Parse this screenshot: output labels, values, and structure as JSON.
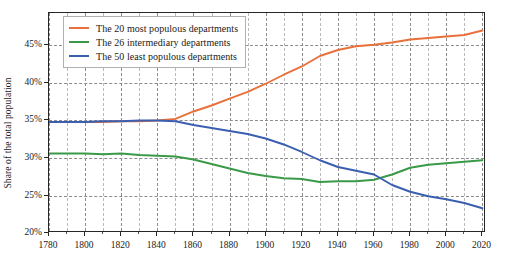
{
  "chart_data": {
    "type": "line",
    "title": "",
    "xlabel": "",
    "ylabel": "Share of the total population",
    "xlim": [
      1780,
      2022
    ],
    "ylim": [
      20,
      49.33
    ],
    "grid": true,
    "legend_position": "upper left",
    "xticks": [
      1780,
      1800,
      1820,
      1840,
      1860,
      1880,
      1900,
      1920,
      1940,
      1960,
      1980,
      2000,
      2020
    ],
    "xticklabels": [
      "1780",
      "1800",
      "1820",
      "1840",
      "1860",
      "1880",
      "1900",
      "1920",
      "1940",
      "1960",
      "1980",
      "2000",
      "2020"
    ],
    "xtick_minor_step": 10,
    "yticks": [
      20,
      25,
      30,
      35,
      40,
      45
    ],
    "yticklabels": [
      "20%",
      "25%",
      "30%",
      "35%",
      "40%",
      "45%"
    ],
    "series": [
      {
        "name": "The 20 most populous departments",
        "color": "#e8703a",
        "x": [
          1780,
          1790,
          1800,
          1810,
          1820,
          1830,
          1840,
          1850,
          1860,
          1870,
          1880,
          1890,
          1900,
          1910,
          1920,
          1930,
          1940,
          1950,
          1960,
          1970,
          1980,
          1990,
          2000,
          2010,
          2020
        ],
        "values": [
          34.8,
          34.8,
          34.8,
          34.8,
          34.9,
          34.9,
          35.0,
          35.2,
          36.2,
          37.0,
          37.9,
          38.8,
          39.9,
          41.1,
          42.2,
          43.6,
          44.4,
          44.9,
          45.1,
          45.4,
          45.8,
          46.0,
          46.2,
          46.4,
          47.0
        ]
      },
      {
        "name": "The 26 intermediary departments",
        "color": "#3a9a47",
        "x": [
          1780,
          1790,
          1800,
          1810,
          1820,
          1830,
          1840,
          1850,
          1860,
          1870,
          1880,
          1890,
          1900,
          1910,
          1920,
          1930,
          1940,
          1950,
          1960,
          1970,
          1980,
          1990,
          2000,
          2010,
          2020
        ],
        "values": [
          30.6,
          30.6,
          30.6,
          30.5,
          30.6,
          30.4,
          30.3,
          30.2,
          29.8,
          29.2,
          28.6,
          28.0,
          27.6,
          27.3,
          27.2,
          26.8,
          26.9,
          26.9,
          27.1,
          27.8,
          28.7,
          29.1,
          29.3,
          29.5,
          29.7
        ]
      },
      {
        "name": "The 50 least populous departments",
        "color": "#3a5fb0",
        "x": [
          1780,
          1790,
          1800,
          1810,
          1820,
          1830,
          1840,
          1850,
          1860,
          1870,
          1880,
          1890,
          1900,
          1910,
          1920,
          1930,
          1940,
          1950,
          1960,
          1970,
          1980,
          1990,
          2000,
          2010,
          2020
        ],
        "values": [
          34.8,
          34.8,
          34.8,
          34.9,
          34.9,
          35.0,
          35.0,
          34.9,
          34.4,
          34.0,
          33.6,
          33.2,
          32.6,
          31.8,
          30.8,
          29.7,
          28.8,
          28.3,
          27.8,
          26.4,
          25.5,
          24.9,
          24.5,
          24.0,
          23.3
        ]
      }
    ]
  },
  "legend": {
    "items": [
      {
        "label": "The 20 most populous departments",
        "color": "#e8703a"
      },
      {
        "label": "The 26 intermediary departments",
        "color": "#3a9a47"
      },
      {
        "label": "The 50 least populous departments",
        "color": "#3a5fb0"
      }
    ]
  },
  "axis": {
    "ylabel": "Share of the total population"
  }
}
